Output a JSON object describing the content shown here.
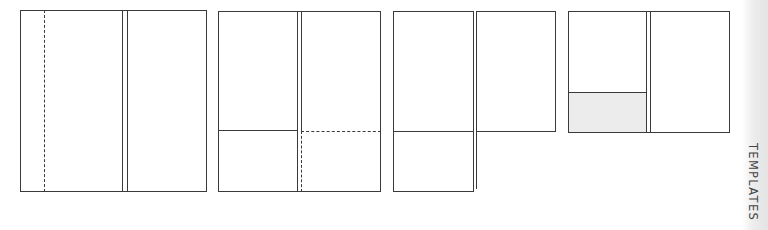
{
  "side_tab": {
    "label": "TEMPLATES"
  },
  "colors": {
    "stroke": "#3a3a3a",
    "shade": "#ececec",
    "strip": "#e4e4e4"
  },
  "templates": [
    {
      "name": "two-panel-with-dashed-fold",
      "panels": 2,
      "dashed_fold": "left panel vertical"
    },
    {
      "name": "two-panel-with-pockets",
      "panels": 2,
      "dashed_fold": "right pocket"
    },
    {
      "name": "two-panel-with-single-pocket",
      "panels": 2,
      "dashed_fold": "none"
    },
    {
      "name": "two-panel-with-shaded-pocket",
      "panels": 2,
      "shaded": "left pocket"
    }
  ]
}
